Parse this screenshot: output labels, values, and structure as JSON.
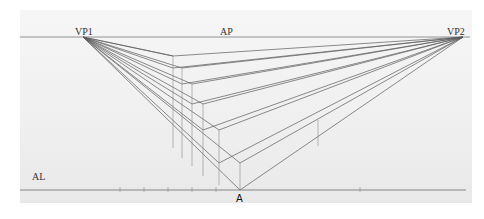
{
  "labels": {
    "vp1": "VP1",
    "vp2": "VP2",
    "ap": "AP",
    "al": "AL",
    "a": "A"
  },
  "colors": {
    "line": "#5a5a5a",
    "thin_line": "#8a8a8a",
    "horizon": "#7a7a7a"
  },
  "geometry": {
    "vp1": [
      83,
      37
    ],
    "vp2": [
      463,
      37
    ],
    "a": [
      240,
      190
    ],
    "horizon": {
      "x1": 20,
      "x2": 470,
      "y": 37
    },
    "ground": {
      "x1": 20,
      "x2": 466,
      "y": 190
    },
    "ground_ticks_x": [
      120,
      144,
      168,
      192,
      216,
      360
    ],
    "front_corners": [
      [
        240,
        190
      ],
      [
        240,
        163
      ],
      [
        219,
        163
      ],
      [
        219,
        130
      ],
      [
        203,
        130
      ],
      [
        203,
        104
      ],
      [
        192,
        104
      ],
      [
        192,
        84
      ],
      [
        182,
        84
      ],
      [
        182,
        68
      ],
      [
        173,
        68
      ],
      [
        173,
        56
      ]
    ],
    "vertical_edges": [
      [
        173,
        56,
        173,
        148
      ],
      [
        182,
        68,
        182,
        158
      ],
      [
        192,
        84,
        192,
        166
      ],
      [
        203,
        104,
        203,
        176
      ],
      [
        219,
        130,
        219,
        185
      ],
      [
        240,
        163,
        240,
        190
      ],
      [
        318,
        120,
        318,
        146
      ]
    ]
  }
}
